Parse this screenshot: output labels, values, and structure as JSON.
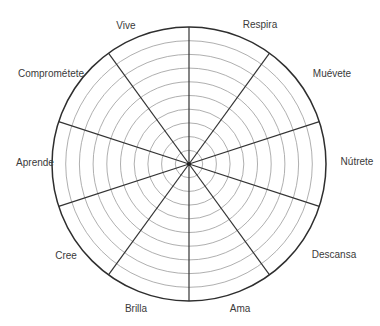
{
  "diagram": {
    "type": "wheel-of-life",
    "center": [
      189,
      164
    ],
    "outer_radius": 137,
    "ring_count": 10,
    "sector_count": 10,
    "colors": {
      "rings": "#9a9a9a",
      "spokes": "#333333",
      "outer": "#2e2e2e",
      "text": "#3a3a3a",
      "background": "#ffffff"
    },
    "labels": [
      {
        "text": "Vive",
        "x": 126,
        "y": 26
      },
      {
        "text": "Respira",
        "x": 260,
        "y": 25
      },
      {
        "text": "Muévete",
        "x": 332,
        "y": 74
      },
      {
        "text": "Nútrete",
        "x": 357,
        "y": 162
      },
      {
        "text": "Descansa",
        "x": 334,
        "y": 255
      },
      {
        "text": "Ama",
        "x": 240,
        "y": 309
      },
      {
        "text": "Brilla",
        "x": 136,
        "y": 309
      },
      {
        "text": "Cree",
        "x": 66,
        "y": 256
      },
      {
        "text": "Aprende",
        "x": 35,
        "y": 163
      },
      {
        "text": "Comprométete",
        "x": 51,
        "y": 74
      }
    ]
  }
}
